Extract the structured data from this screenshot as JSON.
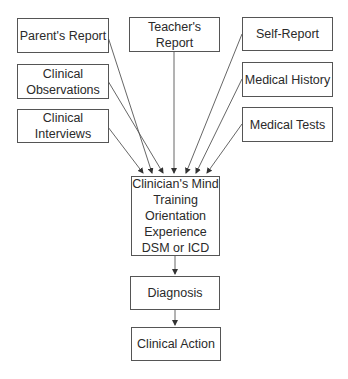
{
  "diagram": {
    "inputs_left": [
      {
        "id": "parents-report",
        "label_lines": [
          "Parent's Report"
        ]
      },
      {
        "id": "clinical-observations",
        "label_lines": [
          "Clinical",
          "Observations"
        ]
      },
      {
        "id": "clinical-interviews",
        "label_lines": [
          "Clinical",
          "Interviews"
        ]
      }
    ],
    "input_center": {
      "id": "teachers-report",
      "label_lines": [
        "Teacher's Report"
      ]
    },
    "inputs_right": [
      {
        "id": "self-report",
        "label_lines": [
          "Self-Report"
        ]
      },
      {
        "id": "medical-history",
        "label_lines": [
          "Medical History"
        ]
      },
      {
        "id": "medical-tests",
        "label_lines": [
          "Medical Tests"
        ]
      }
    ],
    "central": {
      "id": "clinicians-mind",
      "label_lines": [
        "Clinician's Mind",
        "Training",
        "Orientation",
        "Experience",
        "DSM or ICD"
      ]
    },
    "diagnosis": {
      "id": "diagnosis",
      "label_lines": [
        "Diagnosis"
      ]
    },
    "action": {
      "id": "clinical-action",
      "label_lines": [
        "Clinical Action"
      ]
    },
    "edges": [
      {
        "from": "parents-report",
        "to": "clinicians-mind"
      },
      {
        "from": "clinical-observations",
        "to": "clinicians-mind"
      },
      {
        "from": "clinical-interviews",
        "to": "clinicians-mind"
      },
      {
        "from": "teachers-report",
        "to": "clinicians-mind"
      },
      {
        "from": "self-report",
        "to": "clinicians-mind"
      },
      {
        "from": "medical-history",
        "to": "clinicians-mind"
      },
      {
        "from": "medical-tests",
        "to": "clinicians-mind"
      },
      {
        "from": "clinicians-mind",
        "to": "diagnosis"
      },
      {
        "from": "diagnosis",
        "to": "clinical-action"
      }
    ],
    "colors": {
      "stroke": "#555555",
      "text": "#2a2a2a",
      "background": "#ffffff"
    }
  }
}
